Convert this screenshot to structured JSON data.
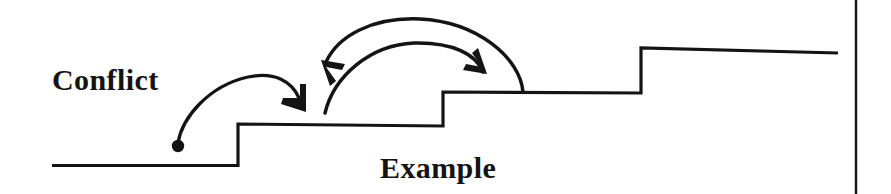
{
  "figure": {
    "type": "hand-drawn-step-diagram",
    "background_color": "#ffffff",
    "ink_color": "#141414",
    "width": 891,
    "height": 194,
    "labels": {
      "conflict": "Conflict",
      "example": "Example"
    },
    "label_positions": {
      "conflict": {
        "x": 52,
        "y": 90,
        "font_size": 30
      },
      "example": {
        "x": 380,
        "y": 178,
        "font_size": 30
      }
    },
    "step_function": {
      "stroke_width": 3.2,
      "points": [
        {
          "x": 52,
          "y": 165
        },
        {
          "x": 238,
          "y": 165
        },
        {
          "x": 238,
          "y": 124
        },
        {
          "x": 443,
          "y": 126
        },
        {
          "x": 443,
          "y": 92
        },
        {
          "x": 641,
          "y": 93
        },
        {
          "x": 641,
          "y": 48
        },
        {
          "x": 838,
          "y": 53
        }
      ],
      "levels": [
        165,
        124,
        92,
        48
      ],
      "riser_x": [
        238,
        443,
        641
      ]
    },
    "origin_dot": {
      "x": 178,
      "y": 146,
      "radius": 6
    },
    "arrows": [
      {
        "name": "conflict-arrow",
        "from": {
          "x": 178,
          "y": 146
        },
        "to": {
          "x": 300,
          "y": 108
        },
        "direction": "left-to-right",
        "stroke_width": 3.2
      },
      {
        "name": "outer-arc-arrow",
        "from": {
          "x": 523,
          "y": 78
        },
        "to": {
          "x": 322,
          "y": 63
        },
        "direction": "right-to-left",
        "peak": {
          "x": 420,
          "y": 18
        },
        "stroke_width": 3.4
      },
      {
        "name": "inner-arc-arrow",
        "from": {
          "x": 325,
          "y": 113
        },
        "to": {
          "x": 484,
          "y": 75
        },
        "direction": "left-to-right",
        "peak": {
          "x": 410,
          "y": 42
        },
        "stroke_width": 3.4
      }
    ],
    "page_rule": {
      "name": "right-margin-rule",
      "x": 856,
      "y_start": 0,
      "y_end": 194,
      "stroke_width": 2.4
    }
  }
}
